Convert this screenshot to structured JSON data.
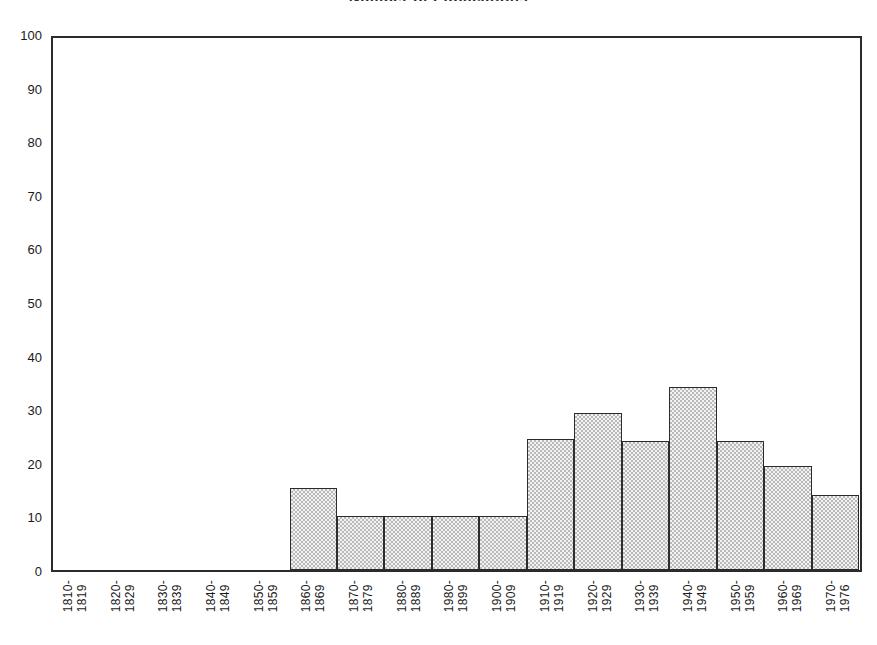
{
  "figure": {
    "title_remnant": "Number of Publications"
  },
  "chart_data": {
    "type": "bar",
    "title": "",
    "subtitle": "",
    "xlabel": "",
    "ylabel": "",
    "ylim": [
      0,
      100
    ],
    "ytick_step": 10,
    "grid": false,
    "legend": null,
    "bar_style": "histogram-adjacent-stippled",
    "categories": [
      "1810-1819",
      "1820-1829",
      "1830-1839",
      "1840-1849",
      "1850-1859",
      "1860-1869",
      "1870-1879",
      "1880-1889",
      "1980-1899",
      "1900-1909",
      "1910-1919",
      "1920-1929",
      "1930-1939",
      "1940-1949",
      "1950-1959",
      "1960-1969",
      "1970-1976"
    ],
    "category_lines": [
      [
        "1810-",
        "1819"
      ],
      [
        "1820-",
        "1829"
      ],
      [
        "1830-",
        "1839"
      ],
      [
        "1840-",
        "1849"
      ],
      [
        "1850-",
        "1859"
      ],
      [
        "1860-",
        "1869"
      ],
      [
        "1870-",
        "1879"
      ],
      [
        "1880-",
        "1889"
      ],
      [
        "1980-",
        "1899"
      ],
      [
        "1900-",
        "1909"
      ],
      [
        "1910-",
        "1919"
      ],
      [
        "1920-",
        "1929"
      ],
      [
        "1930-",
        "1939"
      ],
      [
        "1940-",
        "1949"
      ],
      [
        "1950-",
        "1959"
      ],
      [
        "1960-",
        "1969"
      ],
      [
        "1970-",
        "1976"
      ]
    ],
    "values": [
      0,
      0,
      0,
      0,
      0,
      15.3,
      10,
      10,
      10,
      10,
      24.4,
      29.3,
      24,
      34.2,
      24,
      19.4,
      14
    ],
    "ytick_labels": [
      "0",
      "10",
      "20",
      "30",
      "40",
      "50",
      "60",
      "70",
      "80",
      "90",
      "100"
    ],
    "ytick_values": [
      0,
      10,
      20,
      30,
      40,
      50,
      60,
      70,
      80,
      90,
      100
    ],
    "colors": {
      "bar_fill": "#e0e0e0",
      "bar_edge": "#2b2b2b",
      "axis": "#2b2b2b",
      "text": "#1a1a1a",
      "background": "#ffffff"
    }
  }
}
